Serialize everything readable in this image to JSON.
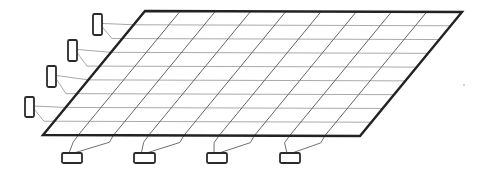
{
  "canvas": {
    "width": 485,
    "height": 174,
    "background": "#ffffff"
  },
  "colors": {
    "outline": "#222222",
    "row_line": "#aaaaaa",
    "column_line": "#666666",
    "lead_row": "#a8a8a8",
    "lead_column": "#707070",
    "terminal": "#2a2a2a"
  },
  "panel": {
    "corners": {
      "top_left": [
        145,
        11
      ],
      "top_right": [
        462,
        12
      ],
      "bottom_right": [
        360,
        136
      ],
      "bottom_left": [
        43,
        135
      ]
    },
    "rows": 9,
    "columns": 9,
    "outline_width": 2.4,
    "row_line_width": 1,
    "column_line_width": 1
  },
  "row_terminals": [
    {
      "x": 93,
      "y": 14,
      "w": 9,
      "h": 21,
      "rows": [
        1,
        2
      ]
    },
    {
      "x": 68,
      "y": 40,
      "w": 9,
      "h": 21,
      "rows": [
        3,
        4
      ]
    },
    {
      "x": 47,
      "y": 66,
      "w": 9,
      "h": 21,
      "rows": [
        5,
        6
      ]
    },
    {
      "x": 25,
      "y": 97,
      "w": 9,
      "h": 20,
      "rows": [
        7,
        8
      ]
    }
  ],
  "column_terminals": [
    {
      "x": 62,
      "y": 153,
      "w": 20,
      "h": 10,
      "columns": [
        1,
        2
      ]
    },
    {
      "x": 134,
      "y": 153,
      "w": 21,
      "h": 10,
      "columns": [
        3,
        4
      ]
    },
    {
      "x": 207,
      "y": 153,
      "w": 20,
      "h": 10,
      "columns": [
        5,
        6
      ]
    },
    {
      "x": 280,
      "y": 153,
      "w": 20,
      "h": 10,
      "columns": [
        7,
        8
      ]
    }
  ],
  "speck": {
    "x": 464,
    "y": 85
  }
}
